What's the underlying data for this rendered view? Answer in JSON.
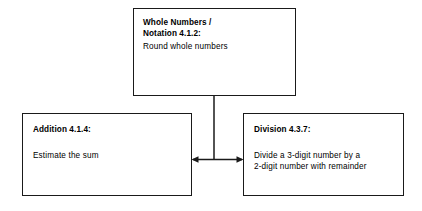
{
  "diagram": {
    "type": "flowchart",
    "orientation": "top-down-split",
    "background_color": "#ffffff",
    "line_color": "#1a1a1a",
    "nodes": [
      {
        "id": "whole-numbers",
        "title": "Whole Numbers /\nNotation 4.1.2:",
        "body": "Round whole numbers"
      },
      {
        "id": "addition",
        "title": "Addition 4.1.4:",
        "body": "Estimate the sum"
      },
      {
        "id": "division",
        "title": "Division 4.3.7:",
        "body": "Divide a 3-digit number by a\n2-digit number with remainder"
      }
    ],
    "connectors": [
      {
        "id": "whole-numbers-to-addition",
        "from": "whole-numbers",
        "to": "addition",
        "arrowhead": "left"
      },
      {
        "id": "whole-numbers-to-division",
        "from": "whole-numbers",
        "to": "division",
        "arrowhead": "right"
      }
    ]
  }
}
